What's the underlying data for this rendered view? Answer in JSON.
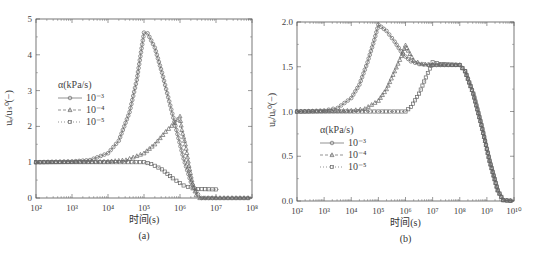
{
  "chart_data": [
    {
      "type": "line",
      "panel": "(a)",
      "caption": "(a)",
      "xlabel": "时间(s)",
      "ylabel": "uₑ/uₛ⁰(−)",
      "xscale": "log",
      "xlim_exp": [
        2,
        8
      ],
      "xticks": [
        "10²",
        "10³",
        "10⁴",
        "10⁵",
        "10⁶",
        "10⁷",
        "10⁸"
      ],
      "ylim": [
        0,
        5
      ],
      "yticks": [
        "0",
        "1",
        "2",
        "3",
        "4",
        "5"
      ],
      "legend": {
        "title": "α(kPa/s)",
        "position": "left-middle"
      },
      "series": [
        {
          "name": "10⁻³",
          "marker": "circle",
          "dash": "solid",
          "points": [
            [
              2,
              1.0
            ],
            [
              3,
              1.02
            ],
            [
              3.5,
              1.06
            ],
            [
              4,
              1.25
            ],
            [
              4.3,
              1.6
            ],
            [
              4.6,
              2.4
            ],
            [
              4.8,
              3.3
            ],
            [
              5.0,
              4.62
            ],
            [
              5.1,
              4.6
            ],
            [
              5.3,
              4.2
            ],
            [
              5.5,
              3.5
            ],
            [
              5.7,
              2.7
            ],
            [
              5.9,
              1.9
            ],
            [
              6.1,
              1.1
            ],
            [
              6.3,
              0.45
            ],
            [
              6.5,
              0.1
            ],
            [
              6.6,
              0.0
            ],
            [
              7,
              0.0
            ],
            [
              8,
              0.0
            ]
          ]
        },
        {
          "name": "10⁻⁴",
          "marker": "triangle",
          "dash": "dashed",
          "points": [
            [
              2,
              1.0
            ],
            [
              4,
              1.02
            ],
            [
              4.5,
              1.06
            ],
            [
              5,
              1.25
            ],
            [
              5.3,
              1.5
            ],
            [
              5.6,
              1.85
            ],
            [
              5.85,
              2.1
            ],
            [
              6.0,
              2.28
            ],
            [
              6.05,
              1.9
            ],
            [
              6.15,
              1.5
            ],
            [
              6.25,
              0.9
            ],
            [
              6.35,
              0.4
            ],
            [
              6.45,
              0.08
            ],
            [
              6.55,
              0.0
            ],
            [
              7,
              0.0
            ],
            [
              8,
              0.0
            ]
          ]
        },
        {
          "name": "10⁻⁵",
          "marker": "square",
          "dash": "dotted",
          "points": [
            [
              2,
              1.0
            ],
            [
              4,
              1.0
            ],
            [
              5,
              1.0
            ],
            [
              5.2,
              0.95
            ],
            [
              5.5,
              0.8
            ],
            [
              5.8,
              0.55
            ],
            [
              6.1,
              0.35
            ],
            [
              6.35,
              0.27
            ],
            [
              6.5,
              0.25
            ],
            [
              7,
              0.24
            ],
            [
              7.1,
              0.24
            ]
          ]
        }
      ]
    },
    {
      "type": "line",
      "panel": "(b)",
      "caption": "(b)",
      "xlabel": "时间(s)",
      "ylabel": "uₑ/uₑ⁰(−)",
      "xscale": "log",
      "xlim_exp": [
        2,
        10
      ],
      "xticks": [
        "10²",
        "10³",
        "10⁴",
        "10⁵",
        "10⁶",
        "10⁷",
        "10⁸",
        "10⁹",
        "10¹⁰"
      ],
      "ylim": [
        0,
        2.0
      ],
      "yticks": [
        "0.0",
        "0.5",
        "1.0",
        "1.5",
        "2.0"
      ],
      "legend": {
        "title": "α(kPa/s)",
        "position": "left-lower"
      },
      "series": [
        {
          "name": "10⁻³",
          "marker": "circle",
          "dash": "solid",
          "points": [
            [
              2,
              1.0
            ],
            [
              3,
              1.01
            ],
            [
              3.5,
              1.04
            ],
            [
              4,
              1.15
            ],
            [
              4.3,
              1.3
            ],
            [
              4.6,
              1.55
            ],
            [
              4.85,
              1.8
            ],
            [
              5.0,
              1.97
            ],
            [
              5.3,
              1.9
            ],
            [
              5.6,
              1.78
            ],
            [
              5.9,
              1.64
            ],
            [
              6.2,
              1.56
            ],
            [
              6.5,
              1.53
            ],
            [
              7,
              1.52
            ],
            [
              8,
              1.52
            ],
            [
              8.2,
              1.45
            ],
            [
              8.5,
              1.2
            ],
            [
              8.8,
              0.85
            ],
            [
              9.1,
              0.45
            ],
            [
              9.4,
              0.12
            ],
            [
              9.6,
              0.01
            ],
            [
              10,
              0.0
            ]
          ]
        },
        {
          "name": "10⁻⁴",
          "marker": "triangle",
          "dash": "dashed",
          "points": [
            [
              2,
              1.0
            ],
            [
              4,
              1.01
            ],
            [
              4.5,
              1.03
            ],
            [
              5,
              1.12
            ],
            [
              5.3,
              1.25
            ],
            [
              5.6,
              1.45
            ],
            [
              5.85,
              1.62
            ],
            [
              6.0,
              1.74
            ],
            [
              6.1,
              1.68
            ],
            [
              6.3,
              1.57
            ],
            [
              6.6,
              1.53
            ],
            [
              7,
              1.52
            ],
            [
              8,
              1.52
            ],
            [
              8.2,
              1.45
            ],
            [
              8.5,
              1.2
            ],
            [
              8.8,
              0.85
            ],
            [
              9.1,
              0.45
            ],
            [
              9.4,
              0.12
            ],
            [
              9.6,
              0.01
            ],
            [
              10,
              0.0
            ]
          ]
        },
        {
          "name": "10⁻⁵",
          "marker": "square",
          "dash": "dotted",
          "points": [
            [
              2,
              1.0
            ],
            [
              5,
              1.0
            ],
            [
              6,
              1.0
            ],
            [
              6.2,
              1.05
            ],
            [
              6.5,
              1.2
            ],
            [
              6.75,
              1.38
            ],
            [
              6.9,
              1.48
            ],
            [
              7.0,
              1.55
            ],
            [
              7.3,
              1.53
            ],
            [
              8,
              1.52
            ],
            [
              8.2,
              1.45
            ],
            [
              8.5,
              1.2
            ],
            [
              8.8,
              0.85
            ],
            [
              9.1,
              0.45
            ],
            [
              9.4,
              0.12
            ],
            [
              9.6,
              0.01
            ],
            [
              10,
              0.0
            ]
          ]
        }
      ]
    }
  ],
  "panels": [
    {
      "caption": "(a)",
      "xlabel": "时间(s)",
      "ylabel": "uₑ/uₛ⁰(−)",
      "legend_title": "α(kPa/s)"
    },
    {
      "caption": "(b)",
      "xlabel": "时间(s)",
      "ylabel": "uₑ/uₑ⁰(−)",
      "legend_title": "α(kPa/s)"
    }
  ],
  "colors": {
    "axis": "#555555",
    "series": "#666666",
    "text": "#333333"
  }
}
